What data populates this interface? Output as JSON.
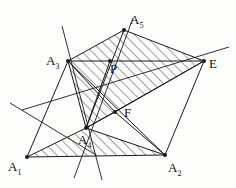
{
  "figure": {
    "stroke_color": "#1a1a1a",
    "hatch_color": "#2b2b2b",
    "background_color": "#fdfdfc",
    "canvas": {
      "width": 236,
      "height": 188
    },
    "points": [
      {
        "id": "A1",
        "label": "A",
        "subscript": "1",
        "x": 27,
        "y": 157,
        "label_x": 8,
        "label_y": 160,
        "dot": true
      },
      {
        "id": "A2",
        "label": "A",
        "subscript": "2",
        "x": 165,
        "y": 155,
        "label_x": 168,
        "label_y": 161,
        "dot": true
      },
      {
        "id": "A3",
        "label": "A",
        "subscript": "3",
        "x": 68,
        "y": 61,
        "label_x": 46,
        "label_y": 54,
        "dot": true
      },
      {
        "id": "A4",
        "label": "A",
        "subscript": "4",
        "x": 86,
        "y": 128,
        "label_x": 78,
        "label_y": 133,
        "dot": true
      },
      {
        "id": "A5",
        "label": "A",
        "subscript": "5",
        "x": 124,
        "y": 30,
        "label_x": 130,
        "label_y": 13,
        "dot": true
      },
      {
        "id": "E",
        "label": "E",
        "subscript": "",
        "x": 204,
        "y": 61,
        "label_x": 209,
        "label_y": 57,
        "dot": true
      },
      {
        "id": "P",
        "label": "P",
        "subscript": "",
        "x": 110,
        "y": 61,
        "label_x": 110,
        "label_y": 62,
        "dot": true
      },
      {
        "id": "F",
        "label": "F",
        "subscript": "",
        "x": 115,
        "y": 112,
        "label_x": 124,
        "label_y": 106,
        "dot": true
      }
    ],
    "segments": [
      {
        "name": "A1-A2-baseline",
        "from": "A1",
        "to": "A2"
      },
      {
        "name": "A1-A4",
        "from": "A1",
        "to": "A4"
      },
      {
        "name": "A2-A4",
        "from": "A2",
        "to": "A4"
      },
      {
        "name": "A3-E",
        "from": "A3",
        "to": "E"
      },
      {
        "name": "A3-A5",
        "from": "A3",
        "to": "A5"
      },
      {
        "name": "A5-E",
        "from": "A5",
        "to": "E"
      },
      {
        "name": "A3-A4",
        "from": "A3",
        "to": "A4"
      },
      {
        "name": "A4-E",
        "from": "A4",
        "to": "E"
      },
      {
        "name": "A4-A5",
        "from": "A4",
        "to": "A5"
      },
      {
        "name": "A2-E",
        "from": "A2",
        "to": "E"
      },
      {
        "name": "A4-F",
        "from": "A4",
        "to": "F"
      },
      {
        "name": "F-E",
        "from": "F",
        "to": "E"
      },
      {
        "name": "F-A2",
        "from": "F",
        "to": "A2"
      },
      {
        "name": "A3-F",
        "from": "A3",
        "to": "F"
      },
      {
        "name": "A3-A2",
        "from": "A3",
        "to": "A2"
      },
      {
        "name": "P-A4",
        "from": "P",
        "to": "A4"
      },
      {
        "name": "A1-A3",
        "from": "A1",
        "to": "A3"
      }
    ],
    "construction_lines": [
      {
        "name": "line-through-A3-A4-extended",
        "x1": 62,
        "y1": 26,
        "x2": 102,
        "y2": 180
      },
      {
        "name": "line-through-A4-P-A5-extended",
        "x1": 74,
        "y1": 178,
        "x2": 133,
        "y2": 18
      },
      {
        "name": "line-through-A4-E-extended",
        "x1": 22,
        "y1": 110,
        "x2": 229,
        "y2": 47
      },
      {
        "name": "line-left-crossing",
        "x1": 10,
        "y1": 103,
        "x2": 96,
        "y2": 155
      }
    ],
    "hatched_regions": [
      {
        "name": "upper-quad-A3-A5-E-A4",
        "polygon": "68,61 124,30 204,61 86,128"
      },
      {
        "name": "lower-triangle-A1-A4-A2",
        "polygon": "27,157 86,128 165,155"
      }
    ],
    "hatch": {
      "angle_deg": 45,
      "spacing_px": 7,
      "stroke_width": 0.9,
      "direction": "lower-left-to-upper-right"
    }
  }
}
